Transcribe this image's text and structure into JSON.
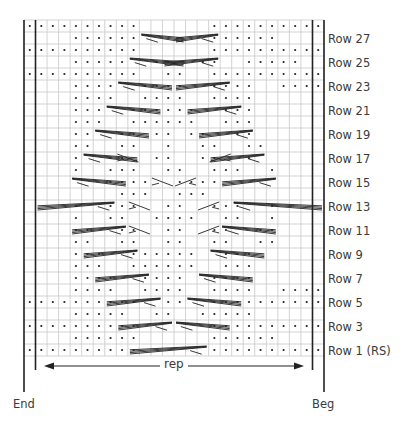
{
  "chart": {
    "title": "",
    "columns": 26,
    "rows_count": 28,
    "row_labels": [
      "Row 27",
      "Row 25",
      "Row 23",
      "Row 21",
      "Row 19",
      "Row 17",
      "Row 15",
      "Row 13",
      "Row 11",
      "Row 9",
      "Row 7",
      "Row 5",
      "Row 3",
      "Row 1 (RS)"
    ],
    "end_label": "End",
    "beg_label": "Beg",
    "rep_label": "rep",
    "grid_color": "#c8c8c8",
    "line_color": "#222222",
    "grid": [
      "..........      ..........",
      "    ......      ......    ",
      "..........      ..........",
      "    .....  ..  ..  .....   ",
      "..........  ..  ..........",
      "    ....  ....  ....  ....",
      "    ....  ....  ....      ",
      "    ...  ......  ...      ",
      "    ...  ......  ...      ",
      "    ..  .. .. ..  ..      ",
      "    ..  ..  .  ..  ..     ",
      "    .  ..  ..  ..  .      ",
      "    .  ...  ..  ...  .    ",
      "       ....  ....         ",
      "        ...  ...          ",
      "    .  ...  ..  ...  .    ",
      "    .  ..  ....  ..  .    ",
      "    ..  ..  ..  ..  ..    ",
      "    ..  ..  ..  ..  ..    ",
      "    ...  ......  ...      ",
      "    ...  ......  ...      ",
      "    ....  ....  ....      ",
      "    ....  ....  ....  ....",
      "..........  ..  ..........",
      "    .....  ..  .....      ",
      "..........      ..........",
      "    ......      ......    ",
      "..........      .........."
    ],
    "cables": [
      {
        "row": 1,
        "from": 9,
        "to": 15,
        "dir": "right"
      },
      {
        "row": 3,
        "from": 8,
        "to": 12,
        "dir": "right"
      },
      {
        "row": 3,
        "from": 13,
        "to": 17,
        "dir": "left"
      },
      {
        "row": 5,
        "from": 7,
        "to": 11,
        "dir": "right"
      },
      {
        "row": 5,
        "from": 14,
        "to": 18,
        "dir": "left"
      },
      {
        "row": 7,
        "from": 6,
        "to": 10,
        "dir": "right"
      },
      {
        "row": 7,
        "from": 15,
        "to": 19,
        "dir": "left"
      },
      {
        "row": 9,
        "from": 5,
        "to": 9,
        "dir": "right"
      },
      {
        "row": 9,
        "from": 16,
        "to": 20,
        "dir": "left"
      },
      {
        "row": 11,
        "from": 4,
        "to": 8,
        "dir": "right"
      },
      {
        "row": 11,
        "from": 17,
        "to": 21,
        "dir": "left"
      },
      {
        "row": 13,
        "from": 1,
        "to": 7,
        "dir": "right"
      },
      {
        "row": 13,
        "from": 18,
        "to": 25,
        "dir": "left"
      },
      {
        "row": 15,
        "from": 4,
        "to": 8,
        "dir": "left"
      },
      {
        "row": 15,
        "from": 17,
        "to": 21,
        "dir": "right"
      },
      {
        "row": 17,
        "from": 5,
        "to": 9,
        "dir": "left"
      },
      {
        "row": 17,
        "from": 16,
        "to": 20,
        "dir": "right"
      },
      {
        "row": 19,
        "from": 6,
        "to": 10,
        "dir": "left"
      },
      {
        "row": 19,
        "from": 15,
        "to": 19,
        "dir": "right"
      },
      {
        "row": 21,
        "from": 7,
        "to": 11,
        "dir": "left"
      },
      {
        "row": 21,
        "from": 14,
        "to": 18,
        "dir": "right"
      },
      {
        "row": 23,
        "from": 8,
        "to": 12,
        "dir": "left"
      },
      {
        "row": 23,
        "from": 13,
        "to": 17,
        "dir": "right"
      },
      {
        "row": 25,
        "from": 9,
        "to": 13,
        "dir": "left"
      },
      {
        "row": 25,
        "from": 12,
        "to": 16,
        "dir": "right"
      },
      {
        "row": 27,
        "from": 10,
        "to": 13,
        "dir": "left"
      },
      {
        "row": 27,
        "from": 13,
        "to": 16,
        "dir": "right"
      }
    ],
    "small_twists": [
      {
        "row": 13,
        "col": 9,
        "dir": "left"
      },
      {
        "row": 13,
        "col": 15,
        "dir": "right"
      },
      {
        "row": 15,
        "col": 11,
        "dir": "left"
      },
      {
        "row": 15,
        "col": 13,
        "dir": "right"
      },
      {
        "row": 17,
        "col": 8,
        "dir": "left"
      },
      {
        "row": 17,
        "col": 16,
        "dir": "right"
      },
      {
        "row": 11,
        "col": 9,
        "dir": "left"
      },
      {
        "row": 11,
        "col": 15,
        "dir": "right"
      }
    ]
  }
}
